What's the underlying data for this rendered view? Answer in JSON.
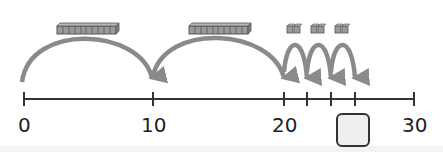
{
  "diagram": {
    "type": "number-line-jumps",
    "number_line": {
      "min": 0,
      "max": 30,
      "labels": [
        "0",
        "10",
        "20",
        "30"
      ],
      "ticks": [
        0,
        10,
        20,
        22,
        24,
        26,
        30
      ]
    },
    "jumps": [
      {
        "from": 0,
        "to": 10,
        "manipulative": "ten-rod",
        "cubes": 10
      },
      {
        "from": 10,
        "to": 20,
        "manipulative": "ten-rod",
        "cubes": 10
      },
      {
        "from": 20,
        "to": 22,
        "manipulative": "two-cubes",
        "cubes": 2
      },
      {
        "from": 22,
        "to": 24,
        "manipulative": "two-cubes",
        "cubes": 2
      },
      {
        "from": 24,
        "to": 26,
        "manipulative": "two-cubes",
        "cubes": 2
      }
    ],
    "answer_box": {
      "position": 26,
      "value": ""
    },
    "colors": {
      "arc": "#8a8a8a",
      "line": "#333333",
      "cube_fill": "#9a9a9a",
      "cube_edge": "#555555",
      "box_fill": "#efefef"
    }
  },
  "labels": {
    "l0": "0",
    "l10": "10",
    "l20": "20",
    "l30": "30"
  }
}
